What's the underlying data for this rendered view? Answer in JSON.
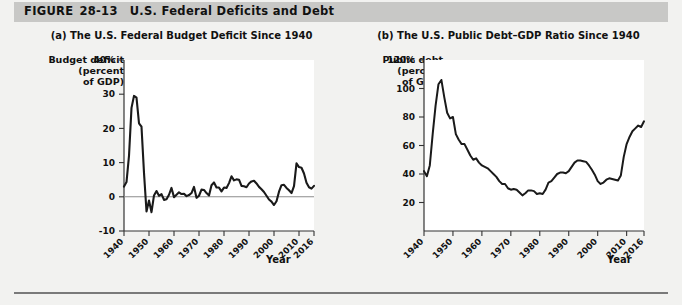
{
  "figure": {
    "label": "FIGURE",
    "number": "28-13",
    "title": "U.S. Federal Deficits and Debt"
  },
  "panel_a": {
    "title": "(a) The U.S. Federal Budget Deficit Since 1940",
    "y_axis_title": "Budget deficit\n(percent\nof GDP)",
    "y_axis_title_line1": "Budget deficit",
    "y_axis_title_line2": "(percent",
    "y_axis_title_line3": "of GDP)",
    "x_axis_title": "Year"
  },
  "panel_b": {
    "title": "(b) The U.S. Public Debt–GDP Ratio Since 1940",
    "y_axis_title_line1": "Public debt",
    "y_axis_title_line2": "(percent",
    "y_axis_title_line3": "of GDP)",
    "x_axis_title": "Year"
  },
  "colors": {
    "header_band": "#c8c8c6",
    "page_background": "#f2f2f0",
    "plot_background": "#ffffff",
    "data_line": "#1a1a1a",
    "zero_line": "#8d8d8d",
    "axis": "#333333",
    "bottom_rule": "#7a7a7a"
  },
  "chart_data": [
    {
      "type": "line",
      "panel": "a",
      "title": "(a) The U.S. Federal Budget Deficit Since 1940",
      "xlabel": "Year",
      "ylabel": "Budget deficit (percent of GDP)",
      "xlim": [
        1940,
        2016
      ],
      "ylim": [
        -10,
        40
      ],
      "grid": false,
      "legend": "none",
      "zero_line": 0,
      "ytick_labels": [
        "40%",
        "30",
        "20",
        "10",
        "0",
        "-10"
      ],
      "yticks": [
        40,
        30,
        20,
        10,
        0,
        -10
      ],
      "xticks": [
        1940,
        1950,
        1960,
        1970,
        1980,
        1990,
        2000,
        2010,
        2016
      ],
      "xtick_labels": [
        "1940",
        "1950",
        "1960",
        "1970",
        "1980",
        "1990",
        "2000",
        "2010",
        "2016"
      ],
      "x": [
        1940,
        1941,
        1942,
        1943,
        1944,
        1945,
        1946,
        1947,
        1948,
        1949,
        1950,
        1951,
        1952,
        1953,
        1954,
        1955,
        1956,
        1957,
        1958,
        1959,
        1960,
        1961,
        1962,
        1963,
        1964,
        1965,
        1966,
        1967,
        1968,
        1969,
        1970,
        1971,
        1972,
        1973,
        1974,
        1975,
        1976,
        1977,
        1978,
        1979,
        1980,
        1981,
        1982,
        1983,
        1984,
        1985,
        1986,
        1987,
        1988,
        1989,
        1990,
        1991,
        1992,
        1993,
        1994,
        1995,
        1996,
        1997,
        1998,
        1999,
        2000,
        2001,
        2002,
        2003,
        2004,
        2005,
        2006,
        2007,
        2008,
        2009,
        2010,
        2011,
        2012,
        2013,
        2014,
        2015,
        2016
      ],
      "y": [
        3.0,
        4.3,
        12.0,
        26.0,
        29.5,
        29.0,
        21.5,
        20.5,
        7.0,
        -4.3,
        -1.1,
        -4.5,
        0.4,
        1.7,
        0.3,
        0.8,
        -0.9,
        -0.7,
        0.6,
        2.6,
        -0.1,
        0.6,
        1.3,
        0.8,
        0.9,
        0.2,
        0.5,
        1.1,
        2.9,
        -0.3,
        0.3,
        2.1,
        2.0,
        1.1,
        0.4,
        3.4,
        4.2,
        2.7,
        2.7,
        1.6,
        2.7,
        2.6,
        4.0,
        6.0,
        4.8,
        5.1,
        5.0,
        3.2,
        3.1,
        2.8,
        3.9,
        4.5,
        4.7,
        3.9,
        2.9,
        2.2,
        1.4,
        0.3,
        -0.8,
        -1.4,
        -2.4,
        -1.3,
        1.5,
        3.4,
        3.5,
        2.6,
        1.9,
        1.1,
        3.1,
        9.8,
        8.7,
        8.5,
        6.8,
        4.1,
        2.8,
        2.4,
        3.2
      ],
      "annotations": [
        "Peak deficit about 30% of GDP during World War II (1943–1945)",
        "Surpluses (negative values) in the late 1990s",
        "Spike to about 10% of GDP in 2009"
      ]
    },
    {
      "type": "line",
      "panel": "b",
      "title": "(b) The U.S. Public Debt–GDP Ratio Since 1940",
      "xlabel": "Year",
      "ylabel": "Public debt (percent of GDP)",
      "xlim": [
        1940,
        2016
      ],
      "ylim": [
        0,
        120
      ],
      "grid": false,
      "legend": "none",
      "ytick_labels": [
        "120%",
        "100",
        "80",
        "60",
        "40",
        "20"
      ],
      "yticks": [
        120,
        100,
        80,
        60,
        40,
        20
      ],
      "xticks": [
        1940,
        1950,
        1960,
        1970,
        1980,
        1990,
        2000,
        2010,
        2016
      ],
      "xtick_labels": [
        "1940",
        "1950",
        "1960",
        "1970",
        "1980",
        "1990",
        "2000",
        "2010",
        "2016"
      ],
      "x": [
        1940,
        1941,
        1942,
        1943,
        1944,
        1945,
        1946,
        1947,
        1948,
        1949,
        1950,
        1951,
        1952,
        1953,
        1954,
        1955,
        1956,
        1957,
        1958,
        1959,
        1960,
        1961,
        1962,
        1963,
        1964,
        1965,
        1966,
        1967,
        1968,
        1969,
        1970,
        1971,
        1972,
        1973,
        1974,
        1975,
        1976,
        1977,
        1978,
        1979,
        1980,
        1981,
        1982,
        1983,
        1984,
        1985,
        1986,
        1987,
        1988,
        1989,
        1990,
        1991,
        1992,
        1993,
        1994,
        1995,
        1996,
        1997,
        1998,
        1999,
        2000,
        2001,
        2002,
        2003,
        2004,
        2005,
        2006,
        2007,
        2008,
        2009,
        2010,
        2011,
        2012,
        2013,
        2014,
        2015,
        2016
      ],
      "y": [
        42.0,
        38.5,
        46.0,
        68.0,
        88.0,
        103.0,
        106.0,
        94.0,
        83.0,
        79.0,
        80.0,
        68.0,
        64.0,
        61.0,
        61.0,
        57.0,
        53.0,
        50.0,
        51.0,
        48.0,
        46.0,
        45.0,
        44.0,
        42.0,
        40.0,
        38.0,
        35.0,
        33.0,
        33.0,
        30.0,
        29.0,
        29.5,
        29.0,
        27.0,
        25.0,
        26.5,
        28.5,
        28.5,
        28.0,
        26.0,
        26.5,
        26.0,
        29.0,
        34.0,
        35.0,
        37.5,
        40.0,
        41.0,
        41.0,
        40.5,
        42.0,
        45.0,
        48.0,
        49.5,
        49.5,
        49.0,
        48.5,
        46.0,
        43.0,
        39.5,
        35.0,
        33.0,
        34.0,
        36.0,
        37.0,
        36.5,
        36.0,
        35.5,
        39.0,
        52.0,
        61.0,
        66.0,
        70.0,
        72.0,
        74.0,
        73.0,
        77.0
      ],
      "annotations": [
        "Peak of about 106% of GDP just after World War II (1946)",
        "Low of roughly 25% in the mid-1970s",
        "Rises to about 77% by 2016"
      ]
    }
  ]
}
